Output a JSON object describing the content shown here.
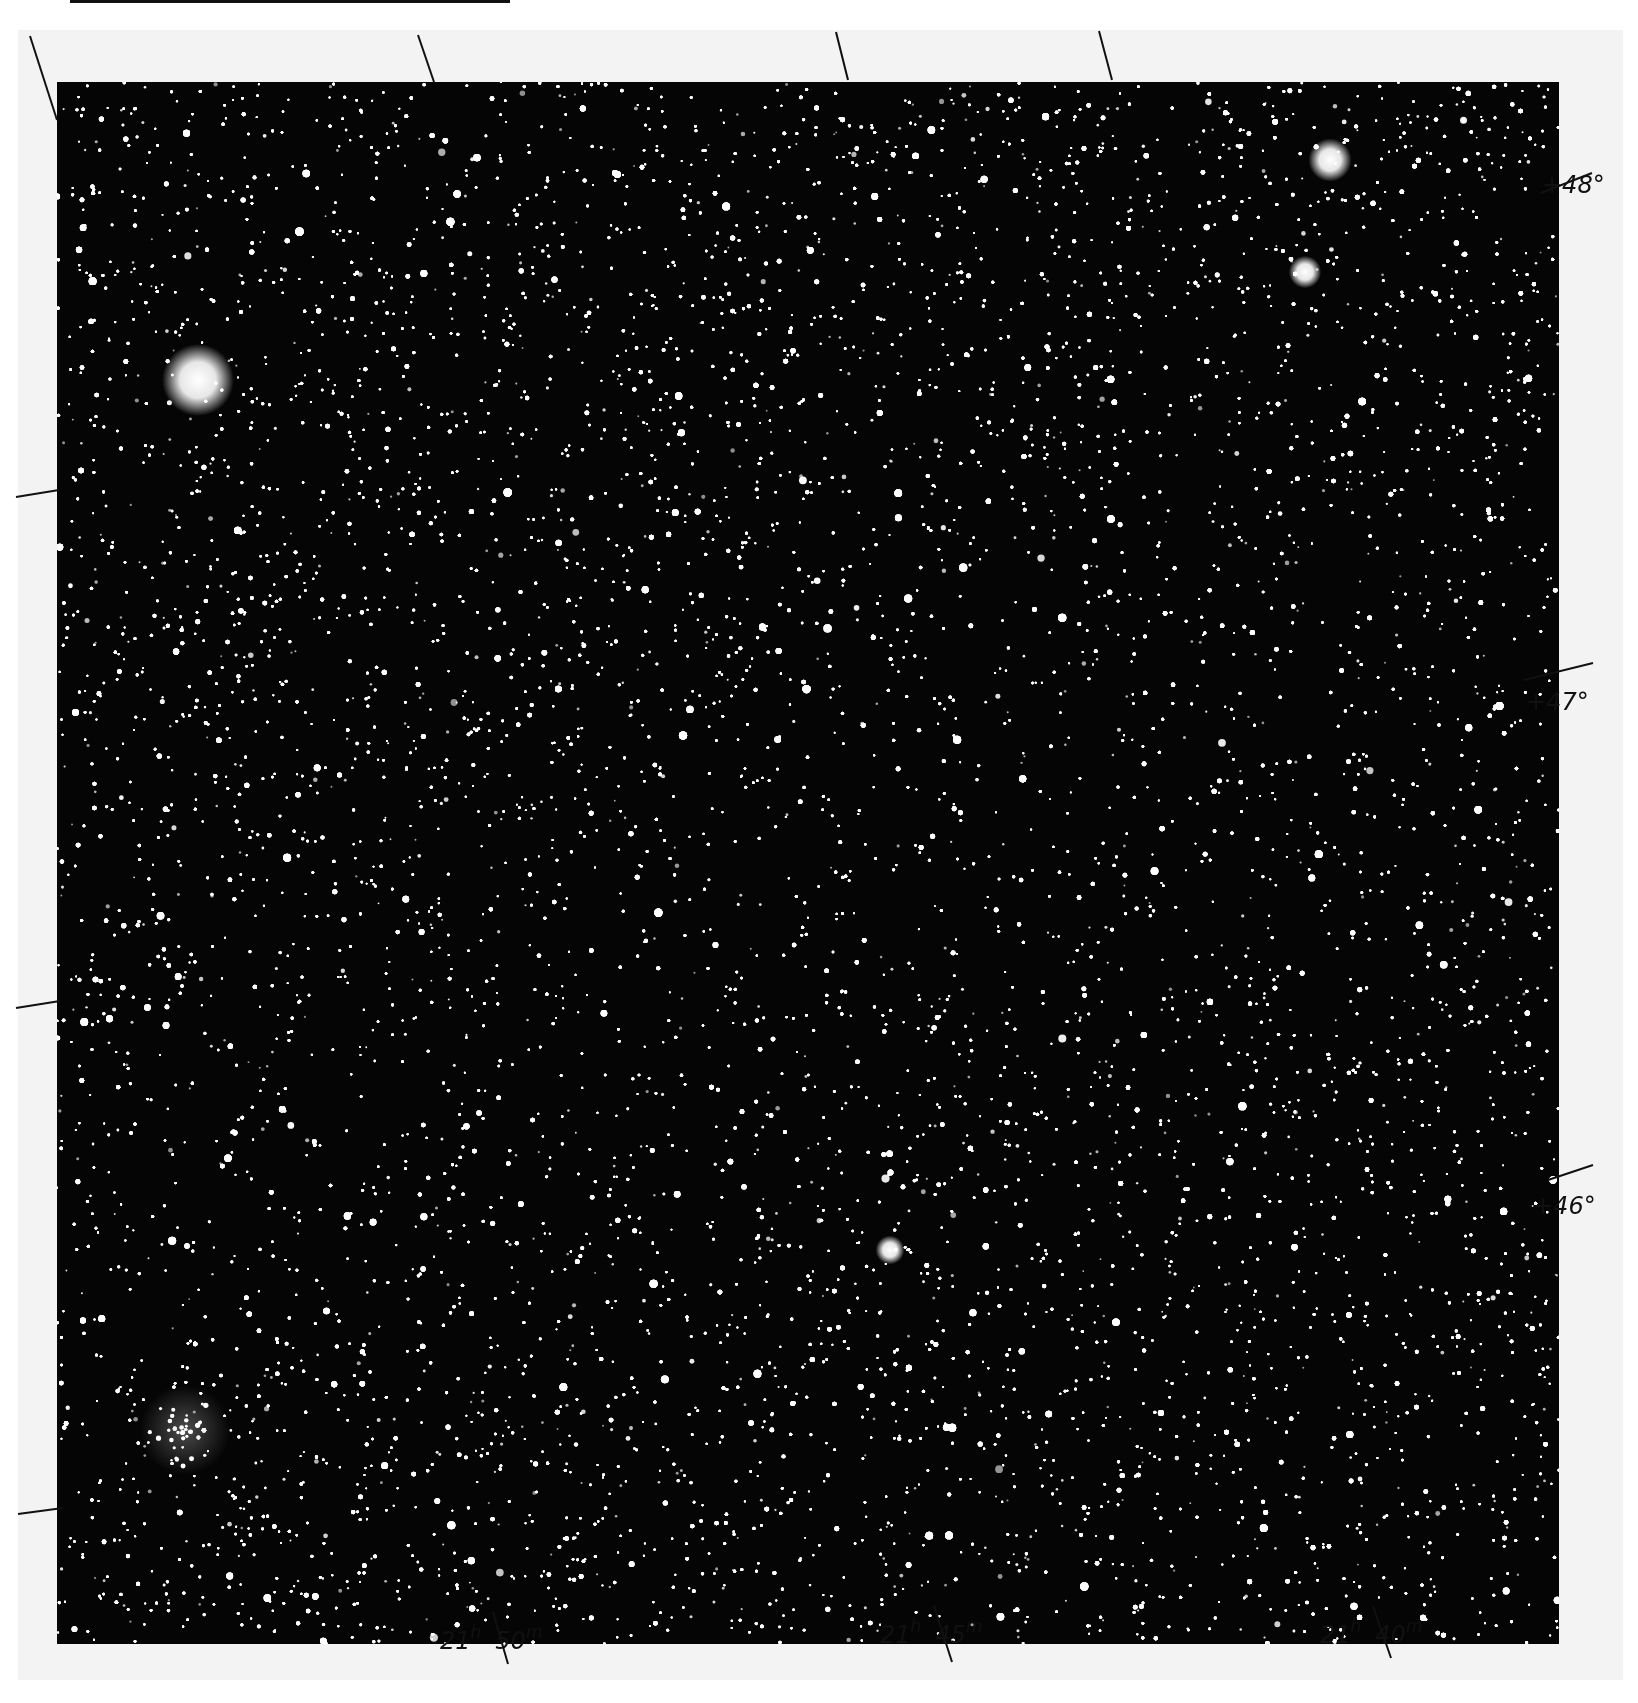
{
  "plate": {
    "background": "#050505",
    "margin_color": "#f3f3f3",
    "star_color": "#ffffff"
  },
  "declination_labels": [
    {
      "text": "+48°",
      "value": 48
    },
    {
      "text": "+47°",
      "value": 47
    },
    {
      "text": "+46°",
      "value": 46
    }
  ],
  "right_ascension_labels": [
    {
      "hours": "21",
      "h_unit": "h",
      "minutes": "50",
      "m_unit": "m"
    },
    {
      "hours": "21",
      "h_unit": "h",
      "minutes": "45",
      "m_unit": "m"
    },
    {
      "hours": "21",
      "h_unit": "h",
      "minutes": "40",
      "m_unit": "m"
    }
  ],
  "notable_objects": [
    {
      "name": "bright-star",
      "x": 198,
      "y": 380,
      "radius": 20
    },
    {
      "name": "nebulous-cluster",
      "x": 185,
      "y": 1430,
      "radius": 45
    },
    {
      "name": "star-group-upper-right",
      "x": 1330,
      "y": 160,
      "radius": 12
    },
    {
      "name": "bright-star-center-lower",
      "x": 890,
      "y": 1250,
      "radius": 8
    },
    {
      "name": "bright-star-upper-right",
      "x": 1305,
      "y": 272,
      "radius": 9
    }
  ]
}
